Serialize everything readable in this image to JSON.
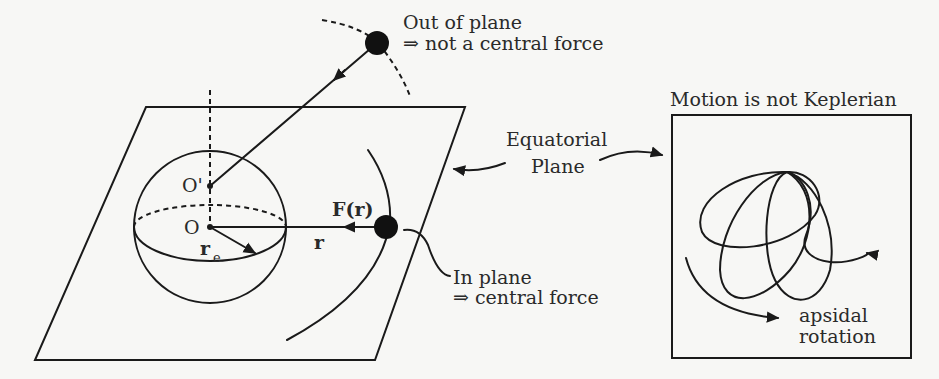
{
  "diagram": {
    "labels": {
      "out_of_plane_line1": "Out of plane",
      "out_of_plane_line2": "⇒ not a central force",
      "equatorial_line1": "Equatorial",
      "equatorial_line2": "Plane",
      "in_plane_line1": "In plane",
      "in_plane_line2": "⇒ central force",
      "force": "F(r)",
      "radius_vector": "r",
      "origin": "O",
      "origin_prime": "O'",
      "equatorial_radius": "r",
      "equatorial_radius_subscript": "e",
      "inset_title": "Motion is not Keplerian",
      "apsidal_line1": "apsidal",
      "apsidal_line2": "rotation"
    },
    "colors": {
      "ink": "#1a1a1a",
      "background": "#f7f7f5",
      "text": "#2a2a2a"
    }
  }
}
